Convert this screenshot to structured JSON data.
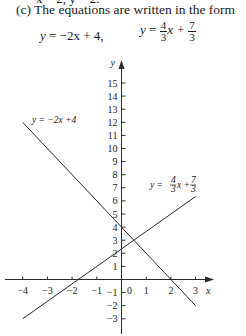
{
  "text": {
    "cut_line": "x = 2, y = 2.",
    "intro": "(c) The equations are written in the form",
    "eq1": {
      "lhs": "y",
      "rhs": " = −2x + 4,"
    },
    "eq2": {
      "lhs": "y",
      "equals": " = ",
      "frac1_num": "4",
      "frac1_den": "3",
      "mid": "x + ",
      "frac2_num": "7",
      "frac2_den": "3"
    }
  },
  "chart_data": {
    "type": "line",
    "title": "",
    "xlabel": "x",
    "ylabel": "y",
    "xlim": [
      -4,
      3.7
    ],
    "ylim": [
      -4.1,
      17
    ],
    "grid": false,
    "x_ticks": [
      -4,
      -3,
      -2,
      -1,
      0,
      1,
      2,
      3
    ],
    "x_tick_labels": [
      "−4",
      "−3",
      "−2",
      "−1",
      "0",
      "1",
      "2",
      "3"
    ],
    "y_ticks": [
      -3,
      -2,
      -1,
      1,
      2,
      3,
      4,
      5,
      6,
      7,
      8,
      9,
      10,
      11,
      12,
      13,
      14,
      15
    ],
    "y_tick_labels": [
      "−3",
      "−2",
      "−1",
      "1",
      "2",
      "3",
      "4",
      "5",
      "6",
      "7",
      "8",
      "9",
      "10",
      "11",
      "12",
      "13",
      "14",
      "15"
    ],
    "series": [
      {
        "name": "y = −2x +4",
        "equation": "y = -2x + 4",
        "x": [
          -4,
          3
        ],
        "y": [
          12,
          -2
        ]
      },
      {
        "name": "y = 4/3 x + 7/3",
        "equation": "y = (4/3)x + 7/3",
        "x": [
          -4,
          3
        ],
        "y": [
          -3,
          6.333
        ]
      }
    ],
    "annotations": [
      {
        "text": "y = −2x +4",
        "near": "upper-left of line 1"
      },
      {
        "text": "y = 4/3 x + 7/3",
        "near": "right end of line 2"
      }
    ],
    "intersection": {
      "x": 0.5,
      "y": 3
    }
  }
}
